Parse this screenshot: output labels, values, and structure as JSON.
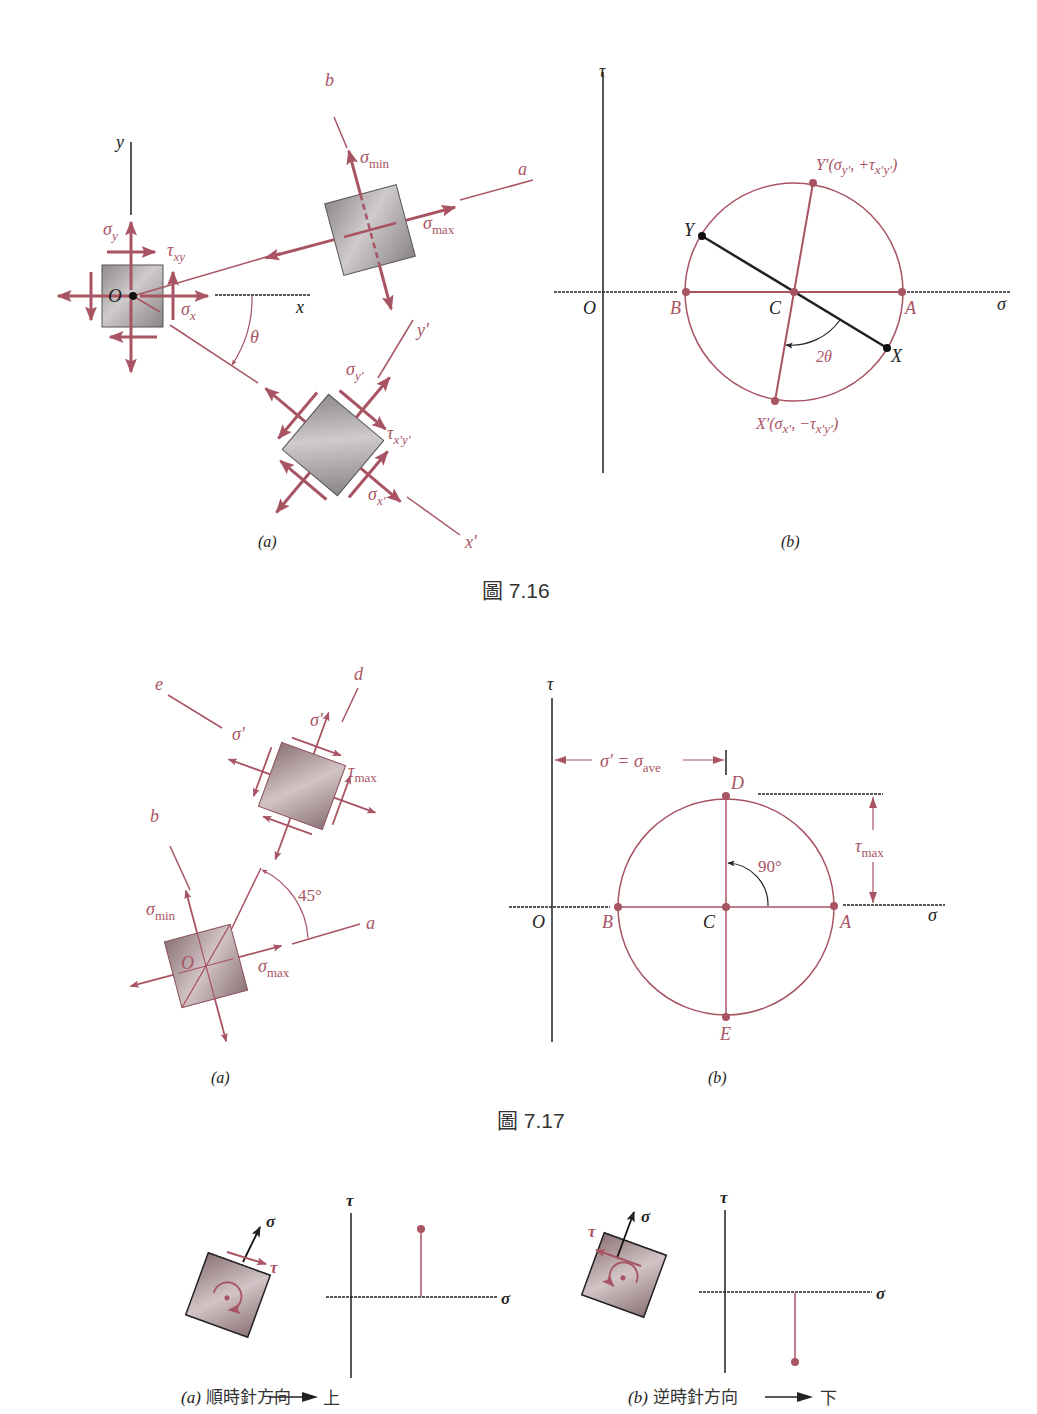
{
  "colors": {
    "accent": "#a85463",
    "axis": "#222222",
    "element_fill": "#a9a4a6",
    "background": "#ffffff"
  },
  "figure_7_16": {
    "caption": "圖 7.16",
    "panel_a": {
      "label": "(a)",
      "axes": {
        "x": "x",
        "y": "y",
        "origin": "O"
      },
      "axis_lines": {
        "a": "a",
        "b": "b",
        "x_prime": "x′",
        "y_prime": "y′"
      },
      "angle": "θ",
      "stresses": {
        "sigma_y": {
          "sym": "σ",
          "sub": "y"
        },
        "tau_xy": {
          "sym": "τ",
          "sub": "xy"
        },
        "sigma_x": {
          "sym": "σ",
          "sub": "x"
        },
        "sigma_min": {
          "sym": "σ",
          "sub": "min"
        },
        "sigma_max": {
          "sym": "σ",
          "sub": "max"
        },
        "sigma_y_prime": {
          "sym": "σ",
          "sub": "y′"
        },
        "tau_x_prime_y_prime": {
          "sym": "τ",
          "sub": "x′y′"
        },
        "sigma_x_prime": {
          "sym": "σ",
          "sub": "x′"
        }
      }
    },
    "panel_b": {
      "label": "(b)",
      "axes": {
        "horizontal": "σ",
        "vertical": "τ",
        "origin": "O"
      },
      "points": {
        "A": "A",
        "B": "B",
        "C": "C",
        "X": "X",
        "Y": "Y",
        "Y_prime": "Y′(σ",
        "Y_prime_sub1": "y′",
        "Y_prime_mid": ", +τ",
        "Y_prime_sub2": "x′y′",
        "Y_prime_end": ")",
        "X_prime": "X′(σ",
        "X_prime_sub1": "x′",
        "X_prime_mid": ", −τ",
        "X_prime_sub2": "x′y′",
        "X_prime_end": ")"
      },
      "angle": "2θ"
    }
  },
  "figure_7_17": {
    "caption": "圖 7.17",
    "panel_a": {
      "label": "(a)",
      "axis_lines": {
        "a": "a",
        "b": "b",
        "d": "d",
        "e": "e"
      },
      "origin": "O",
      "angle": "45°",
      "stresses": {
        "sigma_prime_e": "σ′",
        "sigma_prime_d": "σ′",
        "tau_max": {
          "sym": "τ",
          "sub": "max"
        },
        "sigma_min": {
          "sym": "σ",
          "sub": "min"
        },
        "sigma_max": {
          "sym": "σ",
          "sub": "max"
        }
      }
    },
    "panel_b": {
      "label": "(b)",
      "axes": {
        "horizontal": "σ",
        "vertical": "τ",
        "origin": "O"
      },
      "points": {
        "A": "A",
        "B": "B",
        "C": "C",
        "D": "D",
        "E": "E"
      },
      "dimension_sigma_ave": {
        "lhs": "σ′ = σ",
        "sub": "ave"
      },
      "dimension_tau_max": {
        "sym": "τ",
        "sub": "max"
      },
      "angle": "90°"
    }
  },
  "sign_convention": {
    "panel_a": {
      "label": "(a)",
      "text": "順時針方向",
      "result": "上",
      "sigma": "σ",
      "tau": "τ",
      "axes": {
        "horizontal": "σ",
        "vertical": "τ"
      }
    },
    "panel_b": {
      "label": "(b)",
      "text": "逆時針方向",
      "result": "下",
      "sigma": "σ",
      "tau": "τ",
      "axes": {
        "horizontal": "σ",
        "vertical": "τ"
      }
    }
  }
}
